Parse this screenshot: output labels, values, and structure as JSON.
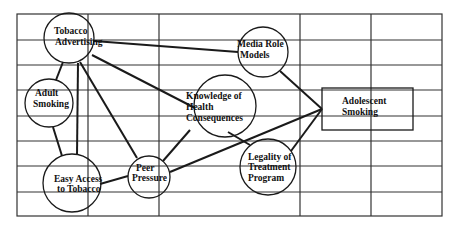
{
  "diagram": {
    "type": "influence-network",
    "grid": {
      "left": 17,
      "right": 442,
      "top": 14,
      "bottom": 216,
      "verticals": [
        88,
        159,
        300,
        371
      ],
      "horizontals": [
        40,
        65,
        90,
        116,
        141,
        166,
        192
      ]
    },
    "nodes": [
      {
        "id": "tobacco",
        "lines": [
          "Tobacco",
          "Advertising"
        ],
        "shape": "circle"
      },
      {
        "id": "adult",
        "lines": [
          "Adult",
          "Smoking"
        ],
        "shape": "circle"
      },
      {
        "id": "easy",
        "lines": [
          "Easy Access",
          "to Tobacco"
        ],
        "shape": "circle"
      },
      {
        "id": "peer",
        "lines": [
          "Peer",
          "Pressure"
        ],
        "shape": "circle"
      },
      {
        "id": "knowledge",
        "lines": [
          "Knowledge of",
          "Health",
          "Consequences"
        ],
        "shape": "circle"
      },
      {
        "id": "media",
        "lines": [
          "Media Role",
          "Models"
        ],
        "shape": "circle"
      },
      {
        "id": "legality",
        "lines": [
          "Legality of",
          "Treatment",
          "Program"
        ],
        "shape": "circle"
      },
      {
        "id": "adolescent",
        "lines": [
          "Adolescent",
          "Smoking"
        ],
        "shape": "rectangle"
      }
    ],
    "edges": [
      [
        "tobacco",
        "media"
      ],
      [
        "tobacco",
        "adult"
      ],
      [
        "tobacco",
        "easy"
      ],
      [
        "tobacco",
        "peer"
      ],
      [
        "tobacco",
        "knowledge"
      ],
      [
        "adult",
        "easy"
      ],
      [
        "easy",
        "peer"
      ],
      [
        "peer",
        "knowledge"
      ],
      [
        "peer",
        "adolescent"
      ],
      [
        "knowledge",
        "legality"
      ],
      [
        "media",
        "adolescent"
      ],
      [
        "legality",
        "adolescent"
      ]
    ],
    "colors": {
      "line": "#222222",
      "background": "#ffffff"
    }
  }
}
